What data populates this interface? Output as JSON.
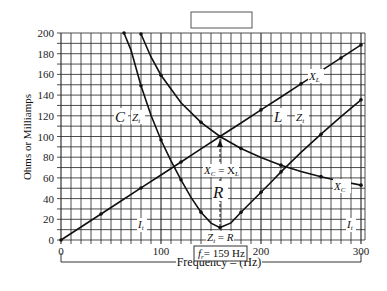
{
  "chart_data": {
    "type": "line",
    "title": "",
    "title_box": "",
    "xlabel": "Frequency – (Hz)",
    "ylabel": "Ohms or Milliamps",
    "xlim": [
      0,
      300
    ],
    "ylim": [
      0,
      200
    ],
    "xticks": [
      0,
      100,
      200,
      300
    ],
    "yticks": [
      0,
      20,
      40,
      60,
      80,
      100,
      120,
      140,
      160,
      180,
      200
    ],
    "grid": true,
    "resonant_frequency_label": "f_r = 159 Hz",
    "resonant_frequency": 159,
    "series": [
      {
        "name": "X_L",
        "x": [
          0,
          20,
          40,
          60,
          80,
          100,
          120,
          140,
          159,
          180,
          200,
          220,
          240,
          260,
          280,
          300
        ],
        "values": [
          0,
          12.6,
          25.1,
          37.7,
          50.3,
          62.8,
          75.4,
          88,
          100,
          113,
          125.7,
          138.2,
          150.8,
          163.4,
          175.9,
          188.5
        ]
      },
      {
        "name": "X_C",
        "x": [
          80,
          90,
          100,
          120,
          140,
          159,
          180,
          200,
          220,
          240,
          260,
          280,
          300
        ],
        "values": [
          199,
          176.8,
          159.2,
          132.6,
          113.7,
          100,
          88.4,
          79.6,
          72.3,
          66.3,
          61.2,
          56.8,
          53
        ]
      },
      {
        "name": "Z_t",
        "x": [
          63,
          70,
          80,
          90,
          100,
          110,
          120,
          130,
          140,
          150,
          159,
          170,
          180,
          190,
          200,
          210,
          220,
          240,
          260,
          280,
          300
        ],
        "values": [
          200,
          183.5,
          149,
          120.5,
          96.6,
          76.4,
          58.1,
          41.2,
          26.9,
          16.3,
          12,
          16.5,
          26.8,
          36.5,
          46.2,
          55.8,
          65.8,
          84.6,
          102.2,
          119.2,
          135.5
        ]
      }
    ],
    "annotations": [
      {
        "text": "C",
        "x": 95,
        "y": 119
      },
      {
        "text": "Z_t",
        "x": 115,
        "y": 119
      },
      {
        "text": "L",
        "x": 253,
        "y": 119
      },
      {
        "text": "Z_t",
        "x": 278,
        "y": 119
      },
      {
        "text": "X_L",
        "x": 252,
        "y": 164
      },
      {
        "text": "X_C",
        "x": 282,
        "y": 54
      },
      {
        "text": "X_C = X_L",
        "x": 159,
        "y": 73
      },
      {
        "text": "R",
        "x": 159,
        "y": 48
      },
      {
        "text": "Z_t = R",
        "x": 159,
        "y": 5
      },
      {
        "text": "I_t",
        "x": 82,
        "y": 18
      },
      {
        "text": "I_t",
        "x": 290,
        "y": 18
      }
    ]
  },
  "labels": {
    "y_axis": "Ohms or Milliamps",
    "x_axis": "Frequency – (Hz)",
    "fr_box": "= 159 Hz",
    "xl": "X",
    "xc": "X",
    "zt": "Z",
    "c": "C",
    "l": "L",
    "r": "R",
    "it": "I",
    "xcxl": "X",
    "ztr": "Z"
  }
}
